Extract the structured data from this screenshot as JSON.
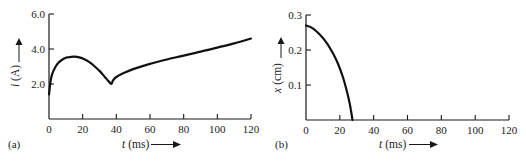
{
  "chart_data": [
    {
      "type": "line",
      "panel_label": "(a)",
      "title": "",
      "xlabel": "t (ms)",
      "ylabel": "i (A)",
      "xlabel_var": "t",
      "xlabel_unit": "(ms)",
      "ylabel_var": "i",
      "ylabel_unit": "(A)",
      "xlim": [
        0,
        120
      ],
      "ylim": [
        0,
        6.0
      ],
      "x_ticks": [
        0,
        20,
        40,
        60,
        80,
        100,
        120
      ],
      "x_tick_labels": [
        "0",
        "20",
        "40",
        "60",
        "80",
        "100",
        "120"
      ],
      "y_ticks": [
        2.0,
        4.0,
        6.0
      ],
      "y_tick_labels": [
        "2.0",
        "4.0",
        "6.0"
      ],
      "grid": false,
      "legend": null,
      "series": [
        {
          "name": "i(t)",
          "x": [
            0,
            1,
            2,
            4,
            6,
            8,
            10,
            12,
            15,
            18,
            21,
            24,
            27,
            30,
            33,
            35,
            37,
            38,
            40,
            45,
            50,
            60,
            70,
            80,
            90,
            100,
            110,
            120
          ],
          "y": [
            1.4,
            2.2,
            2.6,
            3.0,
            3.25,
            3.4,
            3.5,
            3.54,
            3.56,
            3.52,
            3.42,
            3.25,
            3.02,
            2.75,
            2.42,
            2.2,
            2.0,
            2.2,
            2.4,
            2.65,
            2.85,
            3.15,
            3.4,
            3.62,
            3.85,
            4.08,
            4.32,
            4.6
          ]
        }
      ],
      "annotations": [
        "peak ≈ 3.55 A at t ≈ 15 ms",
        "cusp ≈ 2.0 A at t ≈ 37 ms"
      ]
    },
    {
      "type": "line",
      "panel_label": "(b)",
      "title": "",
      "xlabel": "t (ms)",
      "ylabel": "x (cm)",
      "xlabel_var": "t",
      "xlabel_unit": "(ms)",
      "ylabel_var": "x",
      "ylabel_unit": "(cm)",
      "xlim": [
        0,
        120
      ],
      "ylim": [
        0,
        0.3
      ],
      "x_ticks": [
        0,
        20,
        40,
        60,
        80,
        100,
        120
      ],
      "x_tick_labels": [
        "0",
        "20",
        "40",
        "60",
        "80",
        "100",
        "120"
      ],
      "y_ticks": [
        0.1,
        0.2,
        0.3
      ],
      "y_tick_labels": [
        "0.1",
        "0.2",
        "0.3"
      ],
      "grid": false,
      "legend": null,
      "series": [
        {
          "name": "x(t)",
          "x": [
            0,
            4,
            8,
            12,
            16,
            19,
            22,
            24,
            25.5,
            26.5,
            27.5
          ],
          "y": [
            0.27,
            0.262,
            0.245,
            0.222,
            0.19,
            0.16,
            0.12,
            0.085,
            0.055,
            0.03,
            0.0
          ]
        }
      ]
    }
  ]
}
